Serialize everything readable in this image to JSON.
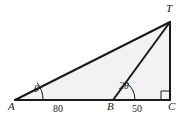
{
  "figure": {
    "background_color": "#ffffff",
    "stroke_color": "#1a1a1a",
    "fill_color": "#f2f2f2",
    "vertices": [
      {
        "name": "A",
        "label": "A",
        "x": 15,
        "y": 100
      },
      {
        "name": "B",
        "label": "B",
        "x": 113,
        "y": 100
      },
      {
        "name": "C",
        "label": "C",
        "x": 170,
        "y": 100
      },
      {
        "name": "T",
        "label": "T",
        "x": 170,
        "y": 22
      }
    ],
    "segments": [
      {
        "name": "segment-AT",
        "from": "A",
        "to": "T"
      },
      {
        "name": "segment-AC",
        "from": "A",
        "to": "C"
      },
      {
        "name": "segment-TC",
        "from": "T",
        "to": "C"
      },
      {
        "name": "segment-BT",
        "from": "B",
        "to": "T"
      }
    ],
    "lengths": [
      {
        "name": "length-AB",
        "label": "80",
        "x": 58,
        "y": 106
      },
      {
        "name": "length-BC",
        "label": "50",
        "x": 136,
        "y": 106
      }
    ],
    "angles": [
      {
        "name": "angle-at-A",
        "label": "θ",
        "vertex": "A",
        "x": 38,
        "y": 86
      },
      {
        "name": "angle-at-B",
        "label": "2θ",
        "vertex": "B",
        "x": 124,
        "y": 84
      },
      {
        "name": "angle-at-C",
        "label": "",
        "vertex": "C",
        "marker": "right-angle"
      }
    ],
    "vertex_labels": [
      {
        "name": "vertex-label-A",
        "label": "A",
        "x": 10,
        "y": 105
      },
      {
        "name": "vertex-label-B",
        "label": "B",
        "x": 109,
        "y": 105
      },
      {
        "name": "vertex-label-C",
        "label": "C",
        "x": 168,
        "y": 105
      },
      {
        "name": "vertex-label-T",
        "label": "T",
        "x": 166,
        "y": 4
      }
    ]
  }
}
